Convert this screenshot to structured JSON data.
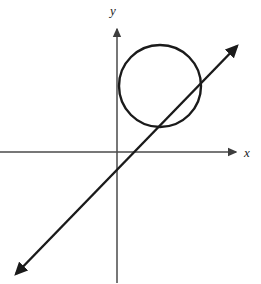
{
  "figure": {
    "width": 261,
    "height": 284,
    "background_color": "#ffffff",
    "ink_color": "#1a1a1a",
    "axis_color": "#4a4a4a"
  },
  "axes": {
    "origin": {
      "x": 117,
      "y": 152
    },
    "x_axis": {
      "label": "x",
      "label_position": {
        "x": 244,
        "y": 146
      },
      "start": {
        "x": 0,
        "y": 152
      },
      "end": {
        "x": 238,
        "y": 152
      },
      "arrow": "right",
      "stroke_width": 1.5,
      "ticks": [],
      "tick_labels": []
    },
    "y_axis": {
      "label": "y",
      "label_position": {
        "x": 110,
        "y": 4
      },
      "start": {
        "x": 117,
        "y": 283
      },
      "end": {
        "x": 117,
        "y": 26
      },
      "arrow": "up",
      "stroke_width": 1.5,
      "ticks": [],
      "tick_labels": []
    }
  },
  "chart_data": {
    "type": "scatter",
    "title": "",
    "subtitle": "",
    "xlabel": "x",
    "ylabel": "y",
    "grid": false,
    "legend": "none",
    "annotations": [],
    "series": [
      {
        "name": "circle",
        "shape": "circle",
        "center": {
          "x": 160,
          "y": 86
        },
        "radius": 41,
        "stroke": "#1a1a1a",
        "stroke_width": 2.4,
        "fill": "none"
      },
      {
        "name": "line",
        "shape": "line",
        "from": {
          "x": 13,
          "y": 277
        },
        "to": {
          "x": 240,
          "y": 43
        },
        "slope_screen": -1.03,
        "arrows": "both",
        "stroke": "#1a1a1a",
        "stroke_width": 2.4
      }
    ],
    "intersections": [
      {
        "x": 156,
        "y": 126
      },
      {
        "x": 198,
        "y": 88
      }
    ]
  }
}
